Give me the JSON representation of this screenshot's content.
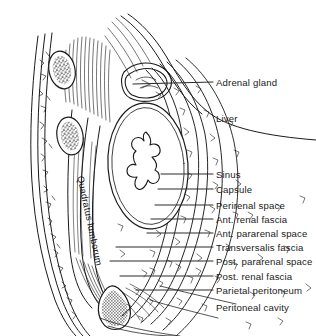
{
  "figure": {
    "background_color": "#ffffff",
    "ink_color": "#1a1a1a",
    "width": 316,
    "height": 336
  },
  "labels": [
    {
      "id": "adrenal-gland",
      "text": "Adrenal gland",
      "x": 216,
      "y": 85,
      "leader": true,
      "leader_x1": 133,
      "leader_y1": 84,
      "leader_x2": 213,
      "leader_y2": 82
    },
    {
      "id": "liver",
      "text": "Liver",
      "x": 216,
      "y": 121,
      "leader": false,
      "leader_x1": 0,
      "leader_y1": 0,
      "leader_x2": 0,
      "leader_y2": 0
    },
    {
      "id": "sinus",
      "text": "Sinus",
      "x": 216,
      "y": 177,
      "leader": true,
      "leader_x1": 161,
      "leader_y1": 174,
      "leader_x2": 213,
      "leader_y2": 174
    },
    {
      "id": "capsule",
      "text": "Capsule",
      "x": 216,
      "y": 192,
      "leader": true,
      "leader_x1": 158,
      "leader_y1": 189,
      "leader_x2": 213,
      "leader_y2": 189
    },
    {
      "id": "perirenal-space",
      "text": "Perirenal space",
      "x": 216,
      "y": 208,
      "leader": true,
      "leader_x1": 155,
      "leader_y1": 205,
      "leader_x2": 213,
      "leader_y2": 205
    },
    {
      "id": "ant-renal-fascia",
      "text": "Ant. renal fascia",
      "x": 216,
      "y": 222,
      "leader": true,
      "leader_x1": 151,
      "leader_y1": 219,
      "leader_x2": 213,
      "leader_y2": 219
    },
    {
      "id": "ant-pararenal-space",
      "text": "Ant. pararenal space",
      "x": 216,
      "y": 236,
      "leader": true,
      "leader_x1": 147,
      "leader_y1": 233,
      "leader_x2": 213,
      "leader_y2": 233
    },
    {
      "id": "transversalis-fascia",
      "text": "Transversalis fascia",
      "x": 216,
      "y": 250,
      "leader": true,
      "leader_x1": 116,
      "leader_y1": 247,
      "leader_x2": 213,
      "leader_y2": 247
    },
    {
      "id": "post-pararenal-space",
      "text": "Post. pararenal space",
      "x": 216,
      "y": 264,
      "leader": true,
      "leader_x1": 110,
      "leader_y1": 261,
      "leader_x2": 213,
      "leader_y2": 261
    },
    {
      "id": "post-renal-fascia",
      "text": "Post. renal fascia",
      "x": 216,
      "y": 279,
      "leader": true,
      "leader_x1": 120,
      "leader_y1": 276,
      "leader_x2": 213,
      "leader_y2": 276
    },
    {
      "id": "parietal-peritoneum",
      "text": "Parietal peritoneum",
      "x": 216,
      "y": 293,
      "leader": true,
      "leader_x1": 136,
      "leader_y1": 290,
      "leader_x2": 213,
      "leader_y2": 290
    },
    {
      "id": "peritoneal-cavity",
      "text": "Peritoneal cavity",
      "x": 216,
      "y": 310,
      "leader": false,
      "leader_x1": 0,
      "leader_y1": 0,
      "leader_x2": 0,
      "leader_y2": 0
    }
  ],
  "vertical_labels": [
    {
      "id": "quadratus-lumborum",
      "text": "Quadratus lumborum",
      "x": 85,
      "y": 175,
      "rotate": 78
    }
  ]
}
